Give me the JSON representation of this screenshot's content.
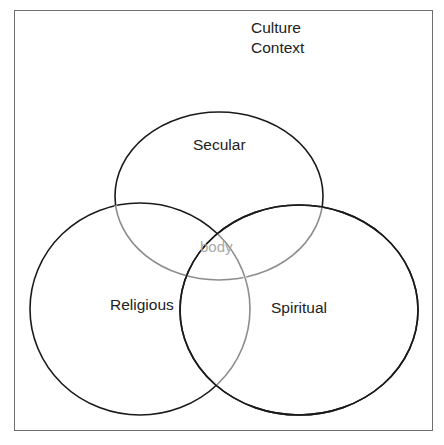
{
  "diagram": {
    "type": "venn",
    "context_label": [
      "Culture",
      "Context"
    ],
    "sets": [
      {
        "id": "secular",
        "label": "Secular"
      },
      {
        "id": "religious",
        "label": "Religious"
      },
      {
        "id": "spiritual",
        "label": "Spiritual"
      }
    ],
    "center_label": "body",
    "colors": {
      "frame": "#6f6f6f",
      "outline": "#1a1a1a",
      "inner_outline": "#8c8c8c",
      "text": "#222222",
      "center_text": "#aaaaaa"
    }
  }
}
